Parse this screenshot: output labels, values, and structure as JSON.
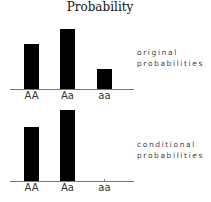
{
  "title": "Probability",
  "chart_data": [
    {
      "type": "bar",
      "title": "Probability",
      "categories": [
        "AA",
        "Aa",
        "aa"
      ],
      "values": [
        0.36,
        0.48,
        0.16
      ],
      "label": [
        "original",
        "probabilities"
      ],
      "xlabel": "",
      "ylabel": "",
      "ylim": [
        0,
        0.6
      ],
      "grid": false,
      "bar_color": "#000000"
    },
    {
      "type": "bar",
      "categories": [
        "AA",
        "Aa",
        "aa"
      ],
      "values": [
        0.43,
        0.57,
        0.0
      ],
      "label": [
        "conditional",
        "probabilities"
      ],
      "xlabel": "",
      "ylabel": "",
      "ylim": [
        0,
        0.6
      ],
      "grid": false,
      "bar_color": "#000000"
    }
  ]
}
